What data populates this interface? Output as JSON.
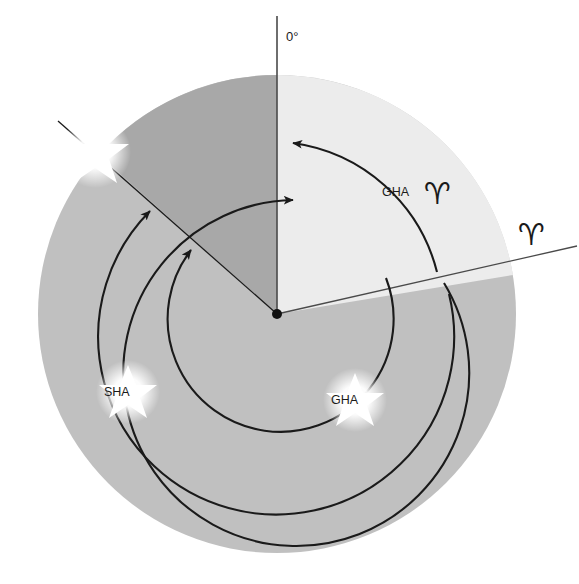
{
  "diagram": {
    "background_color": "#ffffff",
    "colors": {
      "disc": "#c0c0c0",
      "light_sector": "#ececec",
      "dark_wedge": "#a8a8a8",
      "line": "#1a1a1a",
      "star": "#ffffff"
    },
    "center": {
      "x": 277,
      "y": 314,
      "radius": 239
    },
    "labels": {
      "zero_degrees": "0°",
      "gha_aries_text": "GHA",
      "gha_aries_symbol": "♈",
      "aries_symbol": "♈",
      "sha_star": "SHA",
      "gha_star": "GHA"
    },
    "arcs": [
      {
        "name": "sha-arc",
        "label": "SHA",
        "radius": 173,
        "direction": "counterclockwise"
      },
      {
        "name": "gha-aries-arc",
        "label": "GHA ♈",
        "radius": 173,
        "direction": "counterclockwise"
      },
      {
        "name": "gha-star-arc",
        "label": "GHA",
        "radius": 111,
        "direction": "counterclockwise"
      }
    ],
    "markers": {
      "star_body": {
        "x": 95,
        "y": 152
      },
      "sha_star": {
        "x": 128,
        "y": 392
      },
      "gha_star": {
        "x": 355,
        "y": 400
      }
    }
  }
}
